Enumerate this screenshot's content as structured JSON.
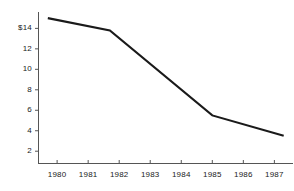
{
  "chart_data": {
    "type": "line",
    "title": "",
    "subtitle": "",
    "xlabel": "",
    "ylabel": "",
    "grid": false,
    "legend": false,
    "legend_position": "none",
    "line_color": "#1a1a1a",
    "background_color": "#ffffff",
    "axis_color": "#555555",
    "x": [
      1979.7,
      1981.7,
      1985.0,
      1987.3
    ],
    "values": [
      15.0,
      13.8,
      5.5,
      3.5
    ],
    "series": [
      {
        "name": "Price",
        "x": [
          1979.7,
          1981.7,
          1985.0,
          1987.3
        ],
        "values": [
          15.0,
          13.8,
          5.5,
          3.5
        ]
      }
    ],
    "xlim": [
      1979.4,
      1987.6
    ],
    "ylim": [
      0.8,
      15.6
    ],
    "x_tick_values": [
      1980,
      1981,
      1982,
      1983,
      1984,
      1985,
      1986,
      1987
    ],
    "x_tick_labels": [
      "1980",
      "1981",
      "1982",
      "1983",
      "1984",
      "1985",
      "1986",
      "1987"
    ],
    "y_tick_values": [
      14,
      12,
      10,
      8,
      6,
      4,
      2
    ],
    "y_tick_labels": [
      "$14",
      "12",
      "10",
      "8",
      "6",
      "4",
      "2"
    ],
    "annotations": []
  },
  "axes": {
    "y_ticks": [
      {
        "label": "$14",
        "value": 14,
        "top": 25
      },
      {
        "label": "12",
        "value": 12,
        "top": 44
      },
      {
        "label": "10",
        "value": 10,
        "top": 63
      },
      {
        "label": "8",
        "value": 8,
        "top": 82
      },
      {
        "label": "6",
        "value": 6,
        "top": 101
      },
      {
        "label": "4",
        "value": 4,
        "top": 120
      },
      {
        "label": "2",
        "value": 2,
        "top": 139
      }
    ],
    "x_ticks": [
      {
        "label": "1980",
        "value": 1980,
        "left": 47
      },
      {
        "label": "1981",
        "value": 1981,
        "left": 83
      },
      {
        "label": "1982",
        "value": 1982,
        "left": 119
      },
      {
        "label": "1983",
        "value": 1983,
        "left": 155
      },
      {
        "label": "1984",
        "value": 1984,
        "left": 191
      },
      {
        "label": "1985",
        "value": 1985,
        "left": 227
      },
      {
        "label": "1986",
        "value": 1986,
        "left": 263
      },
      {
        "label": "1987",
        "value": 1987,
        "left": 299
      }
    ]
  },
  "accessibility": {
    "summary": "Line chart showing a decline from about $15 in 1980 to about $3.5 in 1987."
  }
}
